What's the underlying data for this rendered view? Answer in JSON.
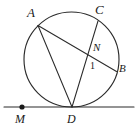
{
  "figure": {
    "stroke_color": "#2b2b2b",
    "label_color": "#1a1a1a",
    "background": "#ffffff",
    "circle": {
      "cx": 71.5,
      "cy": 59.5,
      "r": 47.5
    },
    "points": {
      "A": {
        "label": "A",
        "x": 38.0,
        "y": 25.5,
        "on_circle": true
      },
      "C": {
        "label": "C",
        "x": 98.0,
        "y": 21.0,
        "on_circle": true
      },
      "B": {
        "label": "B",
        "x": 116.5,
        "y": 71.5,
        "on_circle": true
      },
      "D": {
        "label": "D",
        "x": 72.0,
        "y": 107.0,
        "on_circle": true
      },
      "N": {
        "label": "N",
        "x": 98.0,
        "y": 58.0,
        "on_circle": false
      },
      "M": {
        "label": "M",
        "x": 22.0,
        "y": 107.0,
        "on_circle": false
      }
    },
    "segments": [
      {
        "name": "chord-AB",
        "from": "A",
        "to": "B"
      },
      {
        "name": "chord-AD",
        "from": "A",
        "to": "D"
      },
      {
        "name": "chord-CD",
        "from": "C",
        "to": "D"
      }
    ],
    "tangent_line": {
      "name": "tangent-MD",
      "y": 107.0,
      "x1": 4.0,
      "x2": 134.0,
      "touch_point": "D"
    },
    "marked_point": {
      "name": "point-M",
      "x": 22.0,
      "y": 107.0,
      "radius": 2.6
    },
    "angles": [
      {
        "name": "angle-1",
        "label": "1",
        "vertex": "N"
      }
    ]
  }
}
